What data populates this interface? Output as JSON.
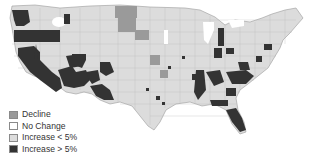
{
  "map": {
    "subject": "Contiguous United States by county",
    "colors": {
      "decline": "#9a9a9a",
      "no_change": "#ffffff",
      "increase_lt_5": "#dcdcdc",
      "increase_gt_5": "#333333",
      "border": "#8a8a8a"
    }
  },
  "legend": {
    "items": [
      {
        "label": "Decline",
        "color": "#9a9a9a"
      },
      {
        "label": "No Change",
        "color": "#ffffff"
      },
      {
        "label": "Increase < 5%",
        "color": "#dcdcdc"
      },
      {
        "label": "Increase > 5%",
        "color": "#333333"
      }
    ]
  }
}
